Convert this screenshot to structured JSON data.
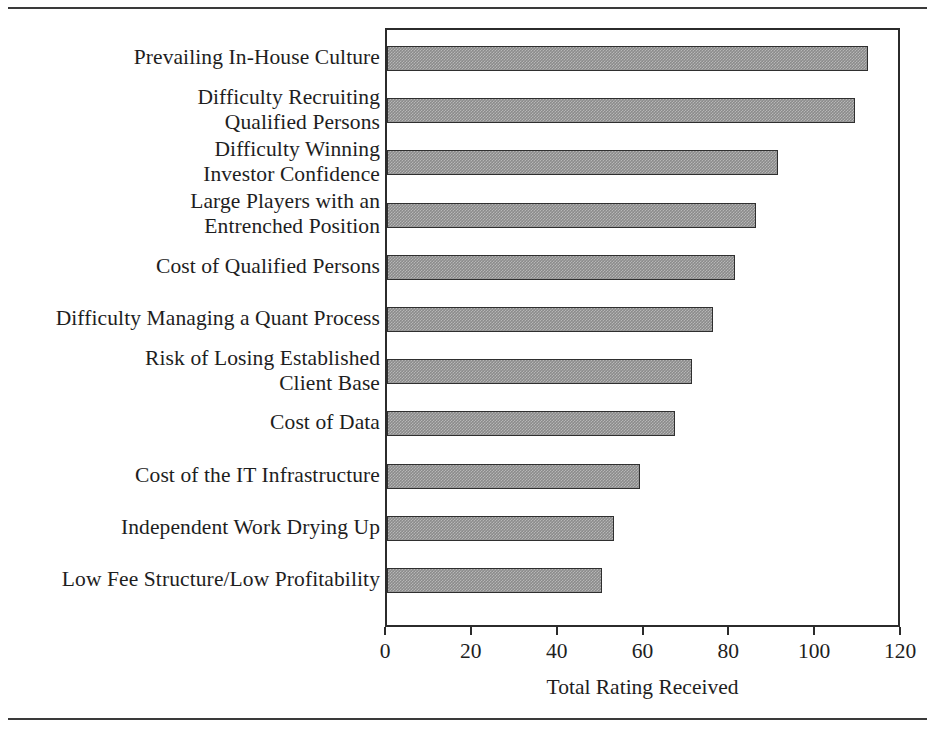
{
  "chart_data": {
    "type": "bar",
    "orientation": "horizontal",
    "title": "",
    "xlabel": "Total Rating Received",
    "ylabel": "",
    "xlim": [
      0,
      120
    ],
    "xticks": [
      0,
      20,
      40,
      60,
      80,
      100,
      120
    ],
    "xtick_labels": [
      "0",
      "20",
      "40",
      "60",
      "80",
      "100",
      "120"
    ],
    "grid": false,
    "legend": false,
    "bar_color": "#8b8b8b",
    "bar_edge_color": "#2f2f2f",
    "categories": [
      "Prevailing In-House Culture",
      "Difficulty Recruiting\nQualified Persons",
      "Difficulty Winning\nInvestor Confidence",
      "Large Players with an\nEntrenched Position",
      "Cost of Qualified Persons",
      "Difficulty Managing a Quant Process",
      "Risk of Losing Established\nClient Base",
      "Cost of Data",
      "Cost of the IT Infrastructure",
      "Independent Work Drying Up",
      "Low Fee Structure/Low Profitability"
    ],
    "values": [
      112,
      109,
      91,
      86,
      81,
      76,
      71,
      67,
      59,
      53,
      50
    ]
  }
}
